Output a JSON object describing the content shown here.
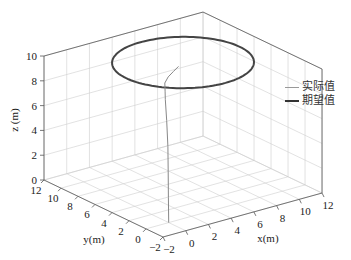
{
  "chart_data": {
    "type": "line3d",
    "title": "",
    "xlabel": "x(m)",
    "ylabel": "y(m)",
    "zlabel": "z (m)",
    "xlim": [
      -2,
      12
    ],
    "ylim": [
      -2,
      12
    ],
    "zlim": [
      0,
      10
    ],
    "x_ticks": [
      -2,
      0,
      2,
      4,
      6,
      8,
      10,
      12
    ],
    "y_ticks": [
      -2,
      0,
      2,
      4,
      6,
      8,
      10,
      12
    ],
    "z_ticks": [
      0,
      2,
      4,
      6,
      8,
      10
    ],
    "grid": true,
    "legend_position": "right",
    "series": [
      {
        "name": "实际值",
        "color": "#888888",
        "linewidth": 1,
        "description": "Actual trajectory rising from (0,0,0) to z≈10 then converging onto the circle",
        "points": [
          [
            0,
            0,
            0
          ],
          [
            0.05,
            0.1,
            2
          ],
          [
            0.1,
            0.2,
            4
          ],
          [
            0.15,
            0.3,
            6
          ],
          [
            0.2,
            0.5,
            8
          ],
          [
            0.3,
            0.8,
            9.6
          ],
          [
            0.8,
            1.5,
            9.9
          ],
          [
            1.6,
            2.6,
            10
          ],
          [
            2.5,
            3.4,
            10
          ],
          [
            3.4,
            4.0,
            10
          ],
          [
            4.3,
            4.6,
            10
          ]
        ],
        "then_follows": "desired circle"
      },
      {
        "name": "期望值",
        "color": "#444444",
        "linewidth": 2,
        "description": "Desired circular trajectory",
        "center": [
          5,
          5,
          10
        ],
        "radius": 5
      }
    ]
  },
  "legend": {
    "items": [
      {
        "label": "实际值",
        "color": "#999999"
      },
      {
        "label": "期望值",
        "color": "#333333"
      }
    ]
  },
  "axes": {
    "x_label": "x(m)",
    "y_label": "y(m)",
    "z_label": "z (m)"
  }
}
